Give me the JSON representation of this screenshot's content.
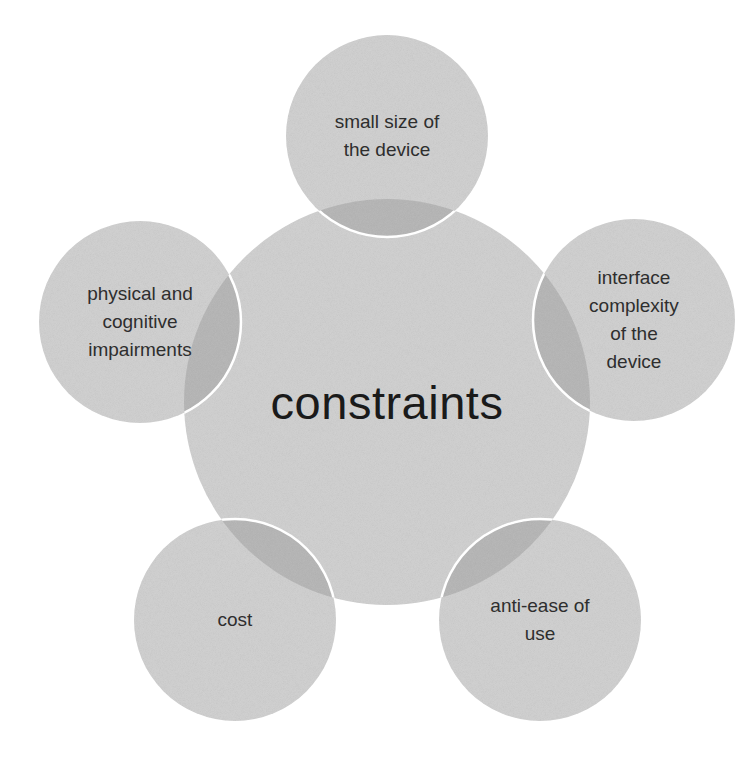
{
  "diagram": {
    "type": "radial-venn",
    "colors": {
      "background": "#ffffff",
      "fill": "#d2d2d2",
      "overlap": "#b9b9b9",
      "stroke": "#ffffff",
      "text": "#2e2e2e",
      "center_text": "#1a1a1a"
    },
    "center": {
      "label": "constraints",
      "cx": 387,
      "cy": 402,
      "r": 203
    },
    "nodes": [
      {
        "id": "small-size",
        "label": "small size of\nthe device",
        "cx": 387,
        "cy": 136,
        "r": 101
      },
      {
        "id": "interface-complexity",
        "label": "interface\ncomplexity\nof the\ndevice",
        "cx": 634,
        "cy": 320,
        "r": 101
      },
      {
        "id": "anti-ease-of-use",
        "label": "anti-ease of\nuse",
        "cx": 540,
        "cy": 620,
        "r": 101
      },
      {
        "id": "cost",
        "label": "cost",
        "cx": 235,
        "cy": 620,
        "r": 101
      },
      {
        "id": "impairments",
        "label": "physical and\ncognitive\nimpairments",
        "cx": 140,
        "cy": 322,
        "r": 101
      }
    ]
  }
}
